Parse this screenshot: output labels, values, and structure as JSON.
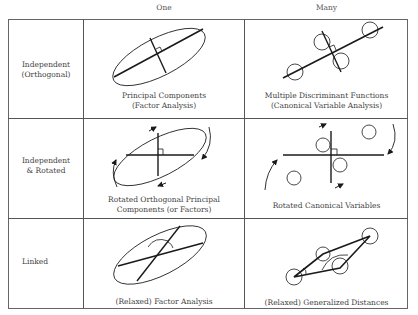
{
  "columns": [
    {
      "label": "One"
    },
    {
      "label": "Many"
    }
  ],
  "rows": [
    {
      "label_line1": "Independent",
      "label_line2": "(Orthogonal)",
      "cells": [
        {
          "caption_line1": "Principal Components",
          "caption_line2": "(Factor Analysis)",
          "figure": "ellipse-with-perpendicular-axes"
        },
        {
          "caption_line1": "Multiple Discriminant Functions",
          "caption_line2": "(Canonical Variable Analysis)",
          "figure": "four-circles-with-perpendicular-axes"
        }
      ]
    },
    {
      "label_line1": "Independent",
      "label_line2": "& Rotated",
      "cells": [
        {
          "caption_line1": "Rotated Orthogonal Principal",
          "caption_line2": "Components (or Factors)",
          "figure": "ellipse-with-rotated-axes-and-arrows"
        },
        {
          "caption_line1": "Rotated Canonical Variables",
          "caption_line2": "",
          "figure": "four-circles-with-rotated-axes-and-arrows"
        }
      ]
    },
    {
      "label_line1": "Linked",
      "label_line2": "",
      "cells": [
        {
          "caption_line1": "(Relaxed) Factor Analysis",
          "caption_line2": "",
          "figure": "ellipse-with-oblique-axes"
        },
        {
          "caption_line1": "(Relaxed) Generalized Distances",
          "caption_line2": "",
          "figure": "four-circles-in-parallelogram"
        }
      ]
    }
  ],
  "colors": {
    "line": "#1a1a1a",
    "border": "#555555",
    "text": "#444444"
  }
}
